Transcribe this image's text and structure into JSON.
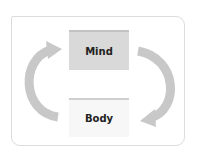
{
  "diagram": {
    "top_node": {
      "label": "Mind"
    },
    "bottom_node": {
      "label": "Body"
    },
    "arrows": [
      {
        "from": "Body",
        "to": "Mind",
        "side": "left",
        "direction": "up"
      },
      {
        "from": "Mind",
        "to": "Body",
        "side": "right",
        "direction": "down"
      }
    ],
    "colors": {
      "arrow": "#c8c8c8",
      "mind_fill": "#d9d9d9",
      "body_fill": "#f7f7f7",
      "frame_border": "#dcdcdc"
    }
  }
}
